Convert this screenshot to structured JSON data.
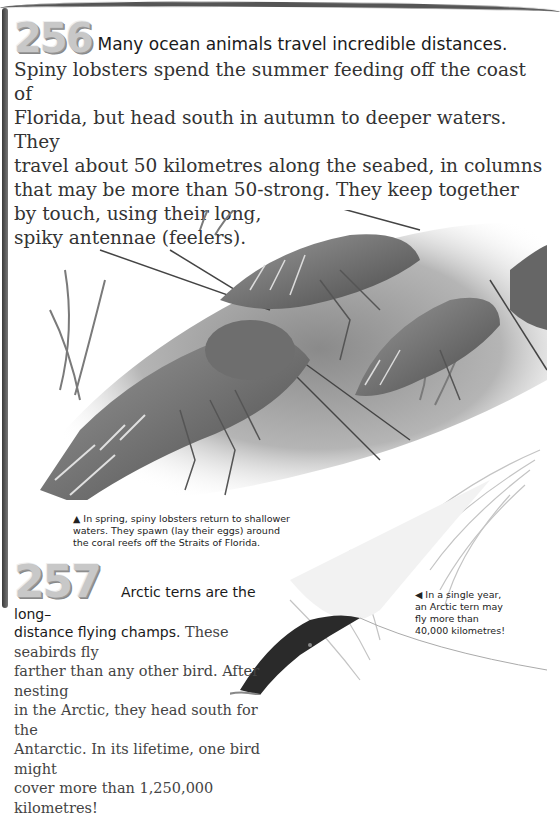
{
  "fact_256": {
    "number": "256",
    "lead": "Many ocean animals travel incredible distances.",
    "lines": [
      "Spiny lobsters spend the summer feeding off the coast of",
      "Florida, but head south in autumn to deeper waters. They",
      "travel about 50 kilometres along the seabed, in columns",
      "that may be more than 50-strong. They keep together",
      "by touch, using their long,",
      "spiky antennae (feelers)."
    ]
  },
  "illustration_lobsters": {
    "alt": "spiny lobsters walking in a column across the seabed"
  },
  "caption_lobsters": {
    "arrow": "▲",
    "text": "In spring, spiny lobsters return to shallower waters. They spawn (lay their eggs) around the coral reefs off the Straits of Florida."
  },
  "fact_257": {
    "number": "257",
    "lead_1": "Arctic terns are the long–",
    "lead_2": "distance flying champs.",
    "lines": [
      "These seabirds fly",
      "farther than any other bird. After nesting",
      "in the Arctic, they head south for the",
      "Antarctic. In its lifetime, one bird might",
      "cover more than 1,250,000 kilometres!"
    ]
  },
  "illustration_tern": {
    "alt": "Arctic tern in flight"
  },
  "caption_tern": {
    "arrow": "◀",
    "lines": [
      "In a single year,",
      "an Arctic tern may",
      "fly more than",
      "40,000 kilometres!"
    ]
  }
}
